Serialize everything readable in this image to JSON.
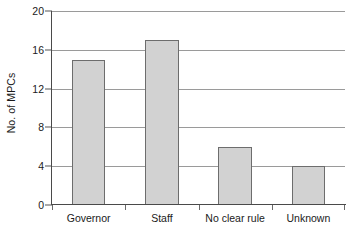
{
  "chart_data": {
    "type": "bar",
    "title": "",
    "subtitle": "",
    "xlabel": "",
    "ylabel": "No. of MPCs",
    "categories": [
      "Governor",
      "Staff",
      "No clear rule",
      "Unknown"
    ],
    "values": [
      15,
      17,
      6,
      4
    ],
    "ylim": [
      0,
      20
    ],
    "y_ticks": [
      0,
      4,
      8,
      12,
      16,
      20
    ],
    "y_tick_labels": [
      "0",
      "4",
      "8",
      "12",
      "16",
      "20"
    ],
    "grid": "horizontal",
    "legend": "none",
    "annotations": [],
    "style": {
      "bar_fill": "#d2d2d2",
      "bar_edge": "#6d6d6d",
      "gridline_color": "#9a9a9a",
      "axis_color": "#4a4a4a",
      "background": "#ffffff",
      "text_color": "#1a1a1a"
    }
  }
}
